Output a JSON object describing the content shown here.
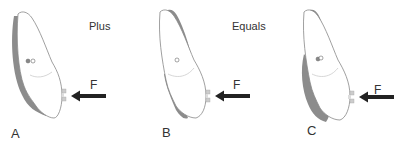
{
  "diagram": {
    "operators": [
      {
        "text": "Plus",
        "x": 89,
        "y": 20
      },
      {
        "text": "Equals",
        "x": 232,
        "y": 20
      }
    ],
    "force_label": "F",
    "panels": [
      {
        "letter": "A",
        "description": "Tooth with displacement shown on lingual side (tipping)"
      },
      {
        "letter": "B",
        "description": "Tooth with displacement shown as translation"
      },
      {
        "letter": "C",
        "description": "Resulting combined movement"
      }
    ],
    "colors": {
      "outline": "#888888",
      "displacement": "#8c8c8c",
      "arrow": "#222222",
      "bracket": "#bbbbbb",
      "text": "#333333"
    }
  }
}
